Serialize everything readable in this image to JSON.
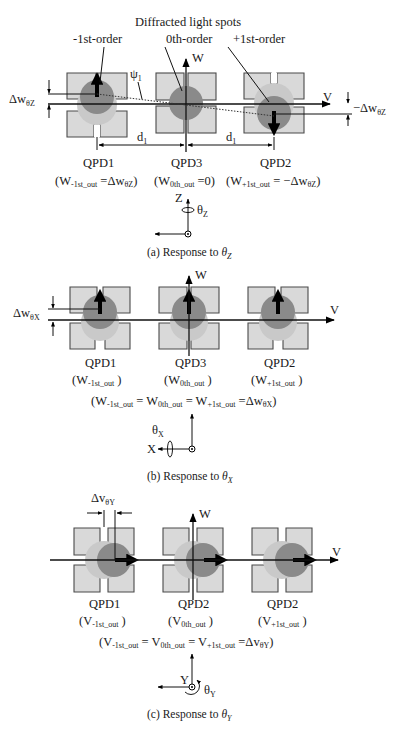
{
  "figure": {
    "panels": [
      {
        "id": "a",
        "caption_prefix": "(a) Response to ",
        "caption_symbol": "θ",
        "caption_sub": "Z",
        "header": "Diffracted light spots",
        "order_labels": [
          "-1st-order",
          "0th-order",
          "+1st-order"
        ],
        "axis_w": "W",
        "axis_v": "V",
        "angle_label": "ψ",
        "angle_sub": "1",
        "delta_left": "Δw",
        "delta_left_sub": "θZ",
        "delta_right": "−Δw",
        "delta_right_sub": "θZ",
        "distance_label": "d",
        "distance_sub": "1",
        "qpds": [
          {
            "name": "QPD1",
            "out_main": "(W",
            "out_sub": "-1st_out",
            "out_tail": " =Δw",
            "out_tail_sub": "θZ",
            "out_close": ")"
          },
          {
            "name": "QPD3",
            "out_main": "(W",
            "out_sub": "0th_out",
            "out_tail": " =0)",
            "out_tail_sub": "",
            "out_close": ""
          },
          {
            "name": "QPD2",
            "out_main": "(W",
            "out_sub": "+1st_out",
            "out_tail": " = −Δw",
            "out_tail_sub": "θZ",
            "out_close": ")"
          }
        ],
        "coord": {
          "up": "Z",
          "rot": "θ",
          "rot_sub": "Z"
        }
      },
      {
        "id": "b",
        "caption_prefix": "(b) Response to ",
        "caption_symbol": "θ",
        "caption_sub": "X",
        "axis_w": "W",
        "axis_v": "V",
        "delta_left": "Δw",
        "delta_left_sub": "θX",
        "qpds": [
          {
            "name": "QPD1",
            "out_main": "(W",
            "out_sub": "-1st_out",
            "out_close": " )"
          },
          {
            "name": "QPD3",
            "out_main": "(W",
            "out_sub": "0th_out",
            "out_close": " )"
          },
          {
            "name": "QPD2",
            "out_main": "(W",
            "out_sub": "+1st_out",
            "out_close": " )"
          }
        ],
        "equation": {
          "p1": "(W",
          "s1": "-1st_out",
          "p2": " = W",
          "s2": "0th_out",
          "p3": " = W",
          "s3": "+1st_out",
          "p4": " =Δw",
          "s4": "θX",
          "p5": ")"
        },
        "coord": {
          "left": "X",
          "rot": "θ",
          "rot_sub": "X"
        }
      },
      {
        "id": "c",
        "caption_prefix": "(c) Response to ",
        "caption_symbol": "θ",
        "caption_sub": "Y",
        "axis_w": "W",
        "axis_v": "V",
        "delta_top": "Δv",
        "delta_top_sub": "θY",
        "qpds": [
          {
            "name": "QPD1",
            "out_main": "(V",
            "out_sub": "-1st_out",
            "out_close": " )"
          },
          {
            "name": "QPD2",
            "out_main": "(V",
            "out_sub": "0th_out",
            "out_close": " )"
          },
          {
            "name": "QPD2",
            "out_main": "(V",
            "out_sub": "+1st_out",
            "out_close": " )"
          }
        ],
        "equation": {
          "p1": "(V",
          "s1": "-1st_out",
          "p2": " = V",
          "s2": "0th_out",
          "p3": " = V",
          "s3": "+1st_out",
          "p4": " =Δv",
          "s4": "θY",
          "p5": ")"
        },
        "coord": {
          "in": "Y",
          "rot": "θ",
          "rot_sub": "Y"
        }
      }
    ]
  }
}
